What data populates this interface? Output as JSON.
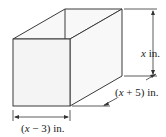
{
  "diagram": {
    "shape": "rectangular box",
    "labels": {
      "height": {
        "var": "x",
        "unit": " in."
      },
      "depth": {
        "prefix": "(",
        "var": "x",
        "rest": " + 5)",
        "unit": " in."
      },
      "width": {
        "prefix": "(",
        "var": "x",
        "rest": " − 3)",
        "unit": " in."
      }
    }
  }
}
